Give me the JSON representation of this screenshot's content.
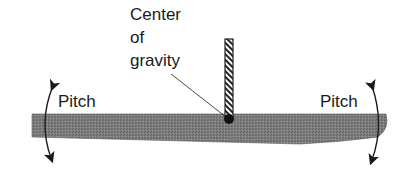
{
  "diagram": {
    "cg_label": {
      "lines": [
        "Center",
        "of",
        "gravity"
      ]
    },
    "pitch_left": "Pitch",
    "pitch_right": "Pitch",
    "colors": {
      "board": "#7a7a7a",
      "board_outline": "#3a3a3a",
      "mast_hatch": "#222222",
      "cg_dot": "#111111",
      "text": "#1a1a1a"
    }
  }
}
